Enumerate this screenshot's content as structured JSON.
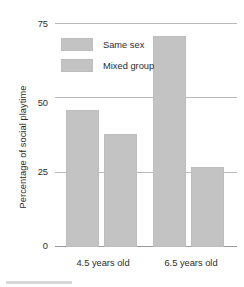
{
  "chart_data": {
    "type": "bar",
    "title": "",
    "subtitle": "",
    "xlabel": "",
    "ylabel": "Percentage of social playtime",
    "categories": [
      "4.5 years old",
      "6.5 years old"
    ],
    "series": [
      {
        "name": "Same sex",
        "values": [
          46,
          71
        ],
        "color": "#c3c3c3"
      },
      {
        "name": "Mixed group",
        "values": [
          38,
          27
        ],
        "color": "#c3c3c3"
      }
    ],
    "ylim": [
      0,
      75
    ],
    "yticks": [
      0,
      25,
      50,
      75
    ],
    "ytick_labels": [
      "0",
      "25",
      "50",
      "75"
    ],
    "grid": true,
    "legend_position": "top-left"
  },
  "axes": {
    "y_title": "Percentage of social playtime",
    "y_tick_0": "0",
    "y_tick_25": "25",
    "y_tick_50": "50",
    "y_tick_75": "75",
    "x_cat_0": "4.5 years old",
    "x_cat_1": "6.5 years old"
  },
  "legend": {
    "items": [
      {
        "label": "Same sex"
      },
      {
        "label": "Mixed group"
      }
    ]
  },
  "colors": {
    "bar_fill": "#c3c3c3",
    "bar_stroke": "#bdbdbd",
    "gridline": "#b9b9b9",
    "baseline": "#9a9a9a",
    "text": "#2b2b2b",
    "background": "#ffffff"
  }
}
